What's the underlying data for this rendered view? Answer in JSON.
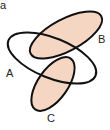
{
  "panel_label": "a",
  "sets": [
    {
      "id": "A",
      "label": "A",
      "filled": false
    },
    {
      "id": "B",
      "label": "B",
      "filled": true
    },
    {
      "id": "C",
      "label": "C",
      "filled": true
    }
  ],
  "colors": {
    "fill": "#f5d6c2",
    "stroke": "#111111",
    "background": "#ffffff"
  }
}
